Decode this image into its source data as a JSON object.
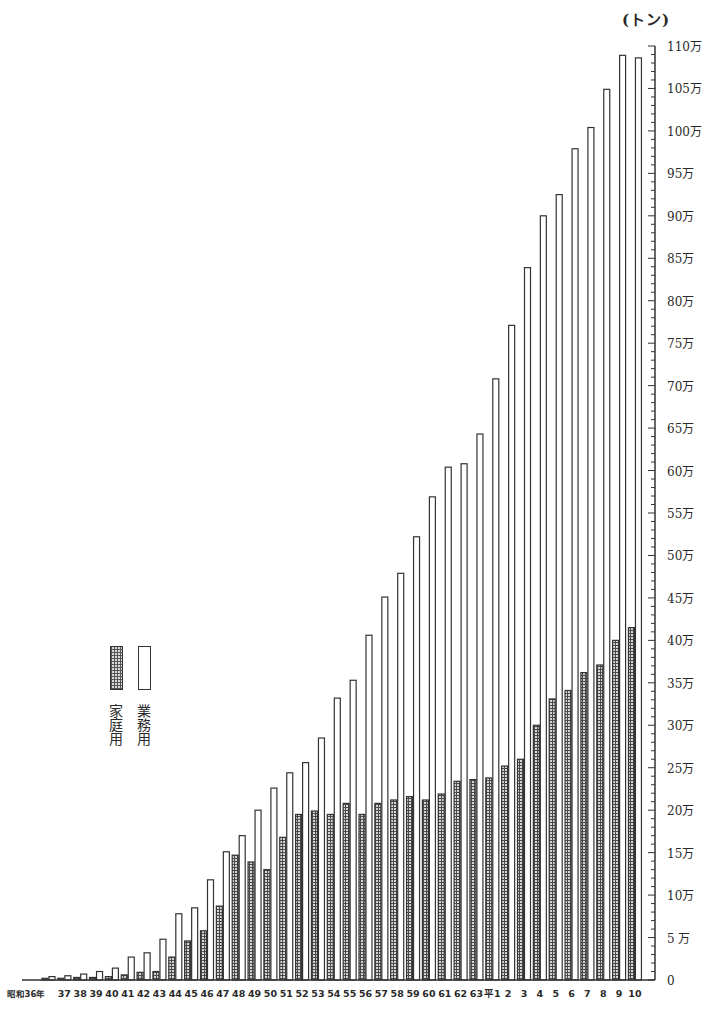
{
  "chart_data": {
    "type": "bar",
    "title": "",
    "unit_label": "(トン)",
    "xlabel": "",
    "ylabel": "(トン)",
    "ylim": [
      0,
      1100000
    ],
    "y_ticks": [
      "0",
      "5 万",
      "10万",
      "15万",
      "20万",
      "25万",
      "30万",
      "35万",
      "40万",
      "45万",
      "50万",
      "55万",
      "60万",
      "65万",
      "70万",
      "75万",
      "80万",
      "85万",
      "90万",
      "95万",
      "100万",
      "105万",
      "110万"
    ],
    "y_tick_values_man": [
      0,
      5,
      10,
      15,
      20,
      25,
      30,
      35,
      40,
      45,
      50,
      55,
      60,
      65,
      70,
      75,
      80,
      85,
      90,
      95,
      100,
      105,
      110
    ],
    "grid": false,
    "legend_position": "left-middle",
    "categories": [
      "昭和36年",
      "37",
      "38",
      "39",
      "40",
      "41",
      "42",
      "43",
      "44",
      "45",
      "46",
      "47",
      "48",
      "49",
      "50",
      "51",
      "52",
      "53",
      "54",
      "55",
      "56",
      "57",
      "58",
      "59",
      "60",
      "61",
      "62",
      "63",
      "平1",
      "2",
      "3",
      "4",
      "5",
      "6",
      "7",
      "8",
      "9",
      "10"
    ],
    "value_unit": "万トン",
    "series": [
      {
        "name": "家庭用",
        "pattern": "hatched",
        "values": [
          0.2,
          0.2,
          0.3,
          0.3,
          0.4,
          0.6,
          0.9,
          1.0,
          2.7,
          4.6,
          5.8,
          8.7,
          14.7,
          13.9,
          13.0,
          16.8,
          19.5,
          19.9,
          19.5,
          20.8,
          19.5,
          20.8,
          21.2,
          21.6,
          21.2,
          21.9,
          23.4,
          23.6,
          23.8,
          25.2,
          26.0,
          30.0,
          33.1,
          34.1,
          36.2,
          37.1,
          40.0,
          41.5
        ]
      },
      {
        "name": "業務用",
        "pattern": "white",
        "values": [
          0.4,
          0.5,
          0.7,
          1.0,
          1.4,
          2.7,
          3.2,
          4.8,
          7.8,
          8.5,
          11.8,
          15.1,
          17.0,
          20.0,
          22.6,
          24.4,
          25.6,
          28.5,
          33.2,
          35.3,
          40.6,
          45.1,
          47.9,
          52.2,
          56.9,
          60.4,
          60.8,
          64.3,
          70.8,
          77.1,
          83.9,
          90.0,
          92.5,
          97.9,
          100.4,
          104.9,
          108.9,
          108.6
        ]
      }
    ]
  },
  "legend": {
    "home_label": "家庭用",
    "biz_label": "業務用"
  }
}
